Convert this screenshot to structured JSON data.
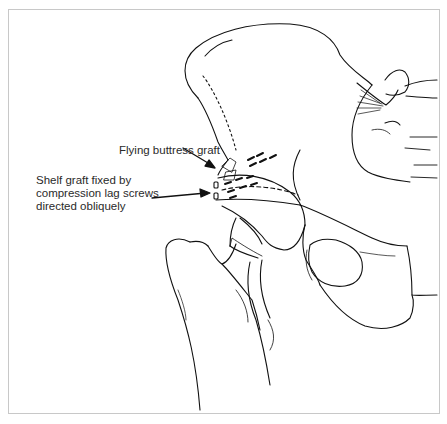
{
  "figure": {
    "border_color": "#c8c8c8",
    "line_color": "#111111",
    "annotations": [
      {
        "id": "flying-buttress",
        "lines": [
          "Flying buttress graft"
        ]
      },
      {
        "id": "shelf-graft",
        "lines": [
          "Shelf graft fixed by",
          "compression lag screws",
          "directed obliquely"
        ]
      }
    ]
  }
}
